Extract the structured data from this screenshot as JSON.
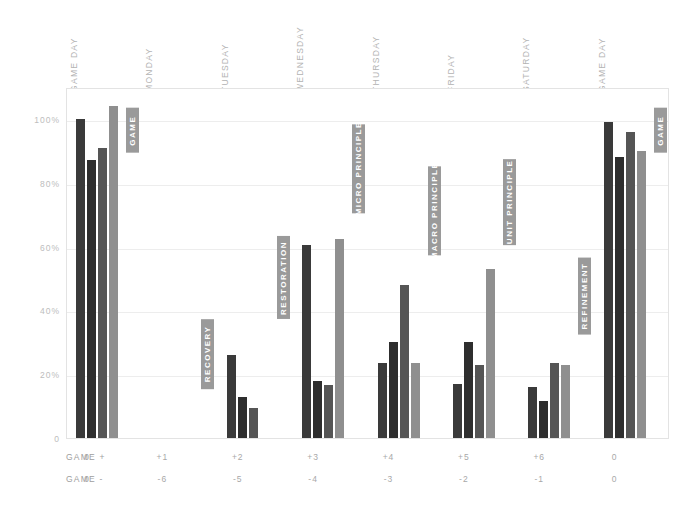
{
  "chart_data": {
    "type": "bar",
    "title": "",
    "subtitle": "",
    "xlabel": "",
    "ylabel": "",
    "ylim": [
      0,
      110
    ],
    "grid": true,
    "legend_position": "none",
    "categories": [
      "GAME DAY",
      "MONDAY",
      "TUESDAY",
      "WEDNESDAY",
      "THURSDAY",
      "FRIDAY",
      "SATURDAY",
      "GAME DAY"
    ],
    "ytick_labels": [
      "0",
      "20%",
      "40%",
      "60%",
      "80%",
      "100%"
    ],
    "ytick_values": [
      0,
      20,
      40,
      60,
      80,
      100
    ],
    "series": [
      {
        "name": "series-1",
        "color": "#3a3a3a",
        "values": [
          100,
          0,
          26,
          60.5,
          23.5,
          17,
          16,
          99
        ]
      },
      {
        "name": "series-2",
        "color": "#2e2e2e",
        "values": [
          87,
          0,
          13,
          18,
          30,
          30,
          11.5,
          88
        ]
      },
      {
        "name": "series-3",
        "color": "#555555",
        "values": [
          91,
          0,
          9.5,
          16.5,
          48,
          23,
          23.5,
          96
        ]
      },
      {
        "name": "series-4",
        "color": "#8f8f8f",
        "values": [
          104,
          0,
          0,
          62.5,
          23.5,
          53,
          23,
          90
        ]
      }
    ],
    "phase_tags": [
      {
        "label": "GAME",
        "group": 0,
        "top_pct": 104,
        "height_pct": 14
      },
      {
        "label": "RECOVERY",
        "group": 1,
        "top_pct": 38,
        "height_pct": 22
      },
      {
        "label": "RESTORATION",
        "group": 2,
        "top_pct": 64,
        "height_pct": 26
      },
      {
        "label": "MICRO PRINCIPLE",
        "group": 3,
        "top_pct": 99,
        "height_pct": 28
      },
      {
        "label": "MACRO PRINCIPLE",
        "group": 4,
        "top_pct": 86,
        "height_pct": 28
      },
      {
        "label": "UNIT PRINCIPLE",
        "group": 5,
        "top_pct": 88,
        "height_pct": 27
      },
      {
        "label": "REFINEMENT",
        "group": 6,
        "top_pct": 57,
        "height_pct": 24
      },
      {
        "label": "GAME",
        "group": 7,
        "top_pct": 104,
        "height_pct": 14
      }
    ],
    "axis_rows": [
      {
        "label": "GAME +",
        "values": [
          "0",
          "+1",
          "+2",
          "+3",
          "+4",
          "+5",
          "+6",
          "0"
        ]
      },
      {
        "label": "GAME -",
        "values": [
          "0",
          "-6",
          "-5",
          "-4",
          "-3",
          "-2",
          "-1",
          "0"
        ]
      }
    ]
  },
  "colors": {
    "frame_border": "#e3e3e3",
    "gridline": "#ededed",
    "tag_background": "#9a9a9a",
    "tag_text": "#ffffff",
    "axis_text": "#b3b3b3",
    "page_background": "#ffffff"
  }
}
